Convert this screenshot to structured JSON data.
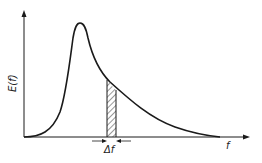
{
  "diagram": {
    "y_axis_label": "E(f)",
    "x_axis_label": "f",
    "band_label": "Δf",
    "curve_description": "energy spectrum with single peak and decaying tail",
    "colors": {
      "line": "#1a1a1a",
      "background": "#ffffff"
    }
  }
}
